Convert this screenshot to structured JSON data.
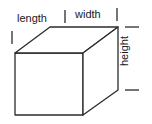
{
  "figure": {
    "background_color": "#ffffff",
    "line_color": "#2b2b2b",
    "text_color": "#1a1a1a",
    "labels": {
      "length": "length",
      "width": "width",
      "height": "height"
    },
    "shape": {
      "type": "rectangular-prism",
      "front_face": {
        "top_left": [
          15,
          53
        ],
        "top_right": [
          83,
          53
        ],
        "bottom_right": [
          83,
          115
        ],
        "bottom_left": [
          15,
          115
        ]
      },
      "back_face": {
        "top_left": [
          50,
          27
        ],
        "top_right": [
          118,
          27
        ],
        "bottom_right": [
          118,
          90
        ]
      }
    },
    "ticks": {
      "length_left": {
        "orientation": "vertical",
        "x": 12,
        "y1": 31,
        "y2": 44
      },
      "length_right": {
        "orientation": "vertical",
        "x": 65,
        "y1": 10,
        "y2": 23
      },
      "width_left": {
        "orientation": "vertical",
        "x": 65,
        "y1": 10,
        "y2": 23
      },
      "width_right": {
        "orientation": "vertical",
        "x": 117,
        "y1": 8,
        "y2": 21
      },
      "height_top": {
        "orientation": "horizontal",
        "y": 27,
        "x1": 125,
        "x2": 139
      },
      "height_bottom": {
        "orientation": "horizontal",
        "y": 90,
        "x1": 125,
        "x2": 139
      }
    }
  }
}
